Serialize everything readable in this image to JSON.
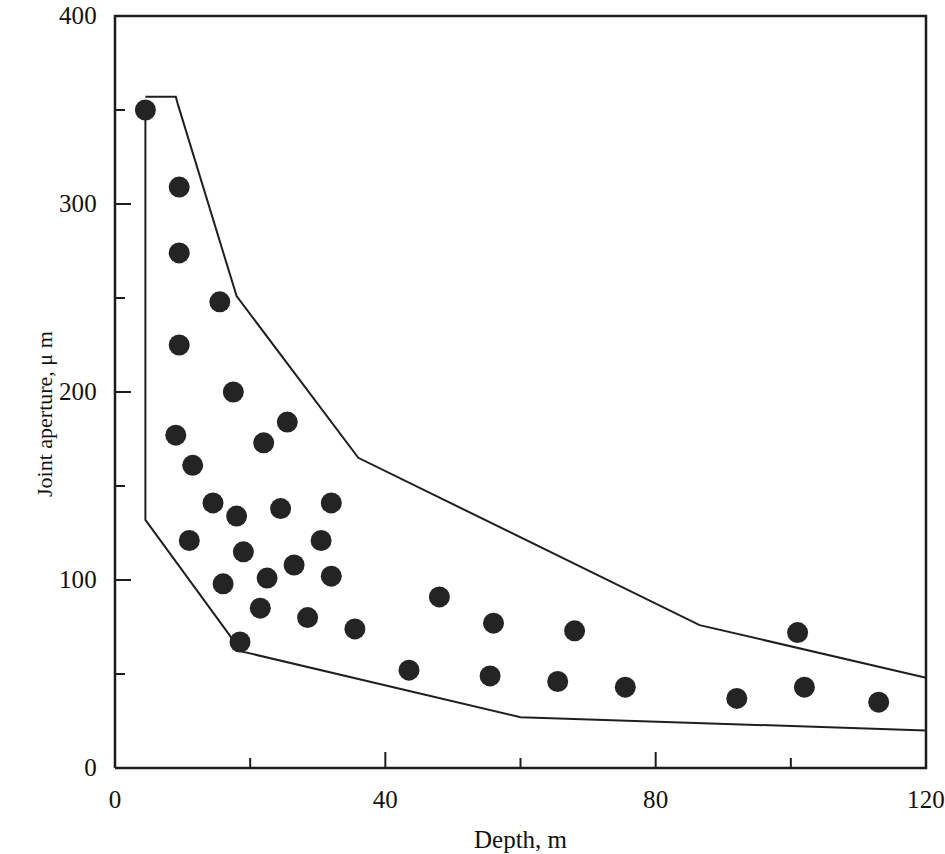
{
  "chart_data": {
    "type": "scatter",
    "title": "",
    "xlabel": "Depth, m",
    "ylabel": "Joint aperture, μ m",
    "xlim": [
      0,
      120
    ],
    "ylim": [
      0,
      400
    ],
    "xticks": [
      0,
      40,
      80,
      120
    ],
    "xtick_labels": [
      "0",
      "40",
      "80",
      "120"
    ],
    "x_minor_ticks": [
      20,
      60,
      100
    ],
    "yticks": [
      0,
      100,
      200,
      300,
      400
    ],
    "ytick_labels": [
      "0",
      "100",
      "200",
      "300",
      "400"
    ],
    "y_minor_ticks": [
      50,
      150,
      250,
      350
    ],
    "grid": false,
    "legend": false,
    "series": [
      {
        "name": "Joint aperture measurements",
        "marker": "filled-circle",
        "color": "#242424",
        "points": [
          {
            "x": 4.5,
            "y": 350
          },
          {
            "x": 9.5,
            "y": 309
          },
          {
            "x": 9.5,
            "y": 274
          },
          {
            "x": 15.5,
            "y": 248
          },
          {
            "x": 9.5,
            "y": 225
          },
          {
            "x": 17.5,
            "y": 200
          },
          {
            "x": 25.5,
            "y": 184
          },
          {
            "x": 22.0,
            "y": 173
          },
          {
            "x": 9.0,
            "y": 177
          },
          {
            "x": 11.5,
            "y": 161
          },
          {
            "x": 14.5,
            "y": 141
          },
          {
            "x": 24.5,
            "y": 138
          },
          {
            "x": 32.0,
            "y": 141
          },
          {
            "x": 18.0,
            "y": 134
          },
          {
            "x": 11.0,
            "y": 121
          },
          {
            "x": 30.5,
            "y": 121
          },
          {
            "x": 19.0,
            "y": 115
          },
          {
            "x": 26.5,
            "y": 108
          },
          {
            "x": 22.5,
            "y": 101
          },
          {
            "x": 32.0,
            "y": 102
          },
          {
            "x": 16.0,
            "y": 98
          },
          {
            "x": 21.5,
            "y": 85
          },
          {
            "x": 28.5,
            "y": 80
          },
          {
            "x": 35.5,
            "y": 74
          },
          {
            "x": 18.5,
            "y": 67
          },
          {
            "x": 48.0,
            "y": 91
          },
          {
            "x": 56.0,
            "y": 77
          },
          {
            "x": 68.0,
            "y": 73
          },
          {
            "x": 101.0,
            "y": 72
          },
          {
            "x": 43.5,
            "y": 52
          },
          {
            "x": 55.5,
            "y": 49
          },
          {
            "x": 65.5,
            "y": 46
          },
          {
            "x": 75.5,
            "y": 43
          },
          {
            "x": 92.0,
            "y": 37
          },
          {
            "x": 102.0,
            "y": 43
          },
          {
            "x": 113.0,
            "y": 35
          }
        ]
      }
    ],
    "envelopes": [
      {
        "name": "upper-bound-envelope",
        "points": [
          {
            "x": 4.5,
            "y": 357
          },
          {
            "x": 9.0,
            "y": 357
          },
          {
            "x": 9.3,
            "y": 353
          },
          {
            "x": 18.0,
            "y": 251
          },
          {
            "x": 36.0,
            "y": 165
          },
          {
            "x": 86.5,
            "y": 76
          },
          {
            "x": 120.0,
            "y": 48
          }
        ]
      },
      {
        "name": "lower-bound-envelope",
        "points": [
          {
            "x": 4.5,
            "y": 353
          },
          {
            "x": 4.5,
            "y": 132
          },
          {
            "x": 18.7,
            "y": 62
          },
          {
            "x": 60.0,
            "y": 27
          },
          {
            "x": 120.0,
            "y": 20
          }
        ]
      }
    ]
  },
  "axes": {
    "x_title": "Depth, m",
    "y_title": "Joint aperture, μ m"
  }
}
